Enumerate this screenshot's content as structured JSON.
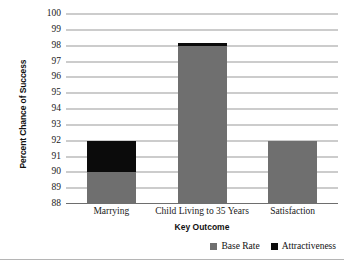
{
  "chart_data": {
    "type": "bar",
    "subtype": "stacked-column",
    "title": "",
    "xlabel": "Key Outcome",
    "ylabel": "Percent Chance of Success",
    "categories": [
      "Marrying",
      "Child Living to 35 Years",
      "Satisfaction"
    ],
    "series": [
      {
        "name": "Base Rate",
        "color": "#6f6f6f",
        "values": [
          90,
          98,
          92
        ]
      },
      {
        "name": "Attractiveness",
        "color": "#0b0b0b",
        "values": [
          2,
          0.2,
          0
        ]
      }
    ],
    "stacked_totals": [
      92,
      98.2,
      92
    ],
    "ylim": [
      88,
      100
    ],
    "ytick_step": 1,
    "yticks": [
      "100",
      "99",
      "98",
      "97",
      "96",
      "95",
      "94",
      "93",
      "92",
      "91",
      "90",
      "89",
      "88"
    ],
    "grid": true,
    "legend_position": "bottom-right"
  },
  "legend": {
    "entries": [
      {
        "label": "Base Rate"
      },
      {
        "label": "Attractiveness"
      }
    ]
  }
}
